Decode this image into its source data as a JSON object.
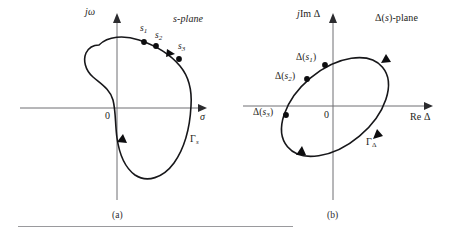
{
  "figure": {
    "panels": [
      {
        "id": "panel-a",
        "caption": "(a)",
        "plane_label": "s-plane",
        "axes": {
          "vertical_label": "jω",
          "horizontal_label": "σ",
          "origin_label": "0"
        },
        "contour_label": "Γ",
        "contour_label_sub": "s",
        "points": [
          {
            "name": "s1",
            "label": "s",
            "sub": "1"
          },
          {
            "name": "s2",
            "label": "s",
            "sub": "2"
          },
          {
            "name": "s3",
            "label": "s",
            "sub": "3"
          }
        ]
      },
      {
        "id": "panel-b",
        "caption": "(b)",
        "plane_label": "Δ(s)-plane",
        "axes": {
          "vertical_label": "jIm Δ",
          "horizontal_label": "Re Δ",
          "origin_label": "0"
        },
        "contour_label": "Γ",
        "contour_label_sub": "Δ",
        "points": [
          {
            "name": "delta-s1",
            "label": "Δ(s",
            "sub": "1",
            "label_tail": ")"
          },
          {
            "name": "delta-s2",
            "label": "Δ(s",
            "sub": "2",
            "label_tail": ")"
          },
          {
            "name": "delta-s3",
            "label": "Δ(s",
            "sub": "3",
            "label_tail": ")"
          }
        ]
      }
    ],
    "colors": {
      "contour": "#17171a",
      "axis": "#6f6f72",
      "marker": "#0d0d0f",
      "rule": "#9a9a9d",
      "background": "#ffffff"
    }
  }
}
